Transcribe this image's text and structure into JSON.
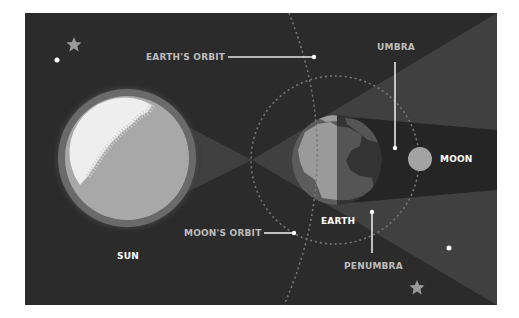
{
  "diagram": {
    "frame": {
      "x": 25,
      "y": 13,
      "width": 472,
      "height": 292
    },
    "colors": {
      "background": "#2b2b2b",
      "penumbra": "#404040",
      "umbra": "#252525",
      "sun_glow": "#6a6a6a",
      "sun_disc": "#a8a8a8",
      "sun_highlight": "#eeeeee",
      "earth_land_lit": "#9a9a9a",
      "earth_land_dark": "#555555",
      "earth_ocean_lit": "#5c5c5c",
      "earth_ocean_dark": "#333333",
      "moon": "#a3a3a3",
      "orbit_dash": "#777777",
      "leader_line": "#e6e6e6",
      "star": "#9a9a9a",
      "dot": "#ffffff"
    },
    "bodies": {
      "sun": {
        "cx": 127,
        "cy": 158,
        "r": 62,
        "glow_r": 69
      },
      "earth": {
        "cx": 337,
        "cy": 160,
        "r": 45
      },
      "moon": {
        "cx": 420,
        "cy": 159,
        "r": 12
      }
    },
    "orbits": {
      "moon_orbit": {
        "cx": 335,
        "cy": 160,
        "r": 84
      },
      "earth_orbit_path": "M 289 13 Q 348 160 284 305"
    },
    "labels": {
      "earths_orbit": "EARTH'S ORBIT",
      "umbra": "UMBRA",
      "moon": "MOON",
      "earth": "EARTH",
      "moons_orbit": "MOON'S ORBIT",
      "penumbra": "PENUMBRA",
      "sun": "SUN"
    },
    "decorations": {
      "stars": [
        {
          "x": 74,
          "y": 45,
          "r": 8
        },
        {
          "x": 417,
          "y": 288,
          "r": 8
        }
      ],
      "dots": [
        {
          "x": 57,
          "y": 60,
          "r": 2.5
        },
        {
          "x": 449,
          "y": 248,
          "r": 2.5
        }
      ]
    }
  }
}
